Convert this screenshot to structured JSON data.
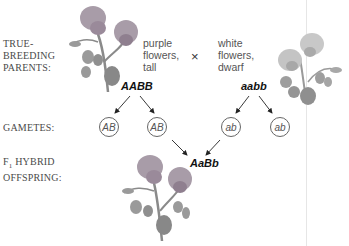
{
  "rows": {
    "parents_label": [
      "TRUE-",
      "BREEDING",
      "PARENTS:"
    ],
    "gametes_label": "GAMETES:",
    "offspring_label_prefix": "F",
    "offspring_label_sub": "1",
    "offspring_label_rest": " HYBRID",
    "offspring_label_line2": "OFFSPRING:"
  },
  "parent1": {
    "description": [
      "purple",
      "flowers,",
      "tall"
    ],
    "genotype": "AABB",
    "gametes": [
      "AB",
      "AB"
    ]
  },
  "cross_symbol": "×",
  "parent2": {
    "description": [
      "white",
      "flowers,",
      "dwarf"
    ],
    "genotype": "aabb",
    "gametes": [
      "ab",
      "ab"
    ]
  },
  "offspring": {
    "genotype": "AaBb"
  },
  "icons": {
    "parent1_plant": "pea-plant-purple-tall",
    "parent2_plant": "pea-plant-white-dwarf",
    "offspring_plant": "pea-plant-hybrid"
  },
  "colors": {
    "purple_flower": "#9a8a9a",
    "white_flower": "#b8b8b8",
    "leaf": "#8f8f8f",
    "text": "#4a4a4a",
    "arrow": "#222222"
  }
}
